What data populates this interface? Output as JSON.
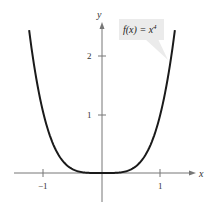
{
  "chart_data": {
    "type": "line",
    "title": "",
    "xlabel": "x",
    "ylabel": "y",
    "xlim": [
      -1.5,
      1.5
    ],
    "ylim": [
      -0.5,
      2.6
    ],
    "grid": false,
    "x_ticks": [
      -1,
      1
    ],
    "x_tick_labels": [
      "−1",
      "1"
    ],
    "y_ticks": [
      1,
      2
    ],
    "y_tick_labels": [
      "1",
      "2"
    ],
    "series": [
      {
        "name": "f(x) = x^4",
        "function": "x^4",
        "x": [
          -1.25,
          -1.0,
          -0.75,
          -0.5,
          -0.25,
          0,
          0.25,
          0.5,
          0.75,
          1.0,
          1.25
        ],
        "values": [
          2.44,
          1.0,
          0.32,
          0.06,
          0.004,
          0,
          0.004,
          0.06,
          0.32,
          1.0,
          2.44
        ],
        "color": "#1a1a1a"
      }
    ],
    "annotations": [
      {
        "text": "f(x) = x⁴",
        "label_base": "f(x) = x",
        "label_exp": "4",
        "points_to": [
          1.18,
          1.95
        ]
      }
    ]
  }
}
